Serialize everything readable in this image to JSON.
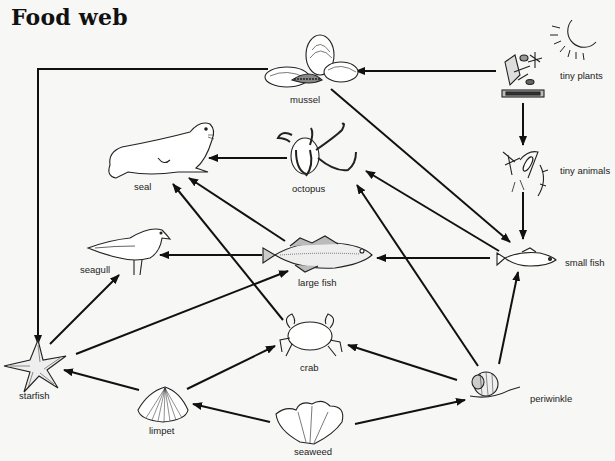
{
  "title": "Food web",
  "nodes": [
    {
      "id": "tiny_plants",
      "label": "tiny plants",
      "icon": "plants-sun-icon"
    },
    {
      "id": "mussel",
      "label": "mussel",
      "icon": "mussel-icon"
    },
    {
      "id": "tiny_animals",
      "label": "tiny animals",
      "icon": "plankton-icon"
    },
    {
      "id": "seal",
      "label": "seal",
      "icon": "seal-icon"
    },
    {
      "id": "octopus",
      "label": "octopus",
      "icon": "octopus-icon"
    },
    {
      "id": "seagull",
      "label": "seagull",
      "icon": "seagull-icon"
    },
    {
      "id": "large_fish",
      "label": "large fish",
      "icon": "large-fish-icon"
    },
    {
      "id": "small_fish",
      "label": "small fish",
      "icon": "small-fish-icon"
    },
    {
      "id": "starfish",
      "label": "starfish",
      "icon": "starfish-icon"
    },
    {
      "id": "crab",
      "label": "crab",
      "icon": "crab-icon"
    },
    {
      "id": "limpet",
      "label": "limpet",
      "icon": "limpet-icon"
    },
    {
      "id": "seaweed",
      "label": "seaweed",
      "icon": "seaweed-icon"
    },
    {
      "id": "periwinkle",
      "label": "periwinkle",
      "icon": "periwinkle-icon"
    }
  ],
  "edges": [
    {
      "from": "tiny_plants",
      "to": "mussel"
    },
    {
      "from": "tiny_plants",
      "to": "tiny_animals"
    },
    {
      "from": "tiny_animals",
      "to": "small_fish"
    },
    {
      "from": "mussel",
      "to": "starfish"
    },
    {
      "from": "mussel",
      "to": "small_fish"
    },
    {
      "from": "octopus",
      "to": "seal"
    },
    {
      "from": "large_fish",
      "to": "seal"
    },
    {
      "from": "crab",
      "to": "seal"
    },
    {
      "from": "small_fish",
      "to": "octopus"
    },
    {
      "from": "periwinkle",
      "to": "octopus"
    },
    {
      "from": "small_fish",
      "to": "large_fish"
    },
    {
      "from": "large_fish",
      "to": "seagull"
    },
    {
      "from": "starfish",
      "to": "seagull"
    },
    {
      "from": "starfish",
      "to": "large_fish"
    },
    {
      "from": "periwinkle",
      "to": "small_fish"
    },
    {
      "from": "limpet",
      "to": "starfish"
    },
    {
      "from": "limpet",
      "to": "crab"
    },
    {
      "from": "periwinkle",
      "to": "crab"
    },
    {
      "from": "seaweed",
      "to": "limpet"
    },
    {
      "from": "seaweed",
      "to": "periwinkle"
    }
  ]
}
